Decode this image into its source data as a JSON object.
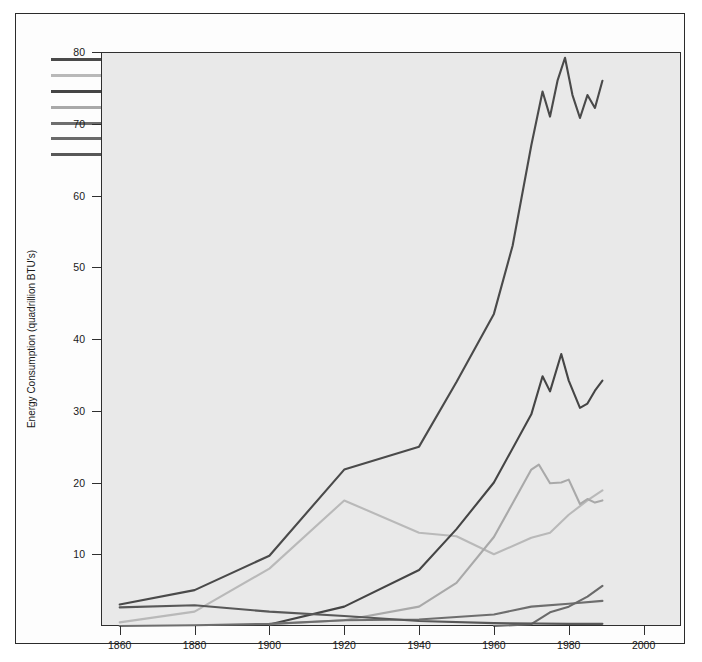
{
  "chart_data": {
    "type": "line",
    "title": "",
    "xlabel": "",
    "ylabel": "Energy Consumption (quadrillion BTU's)",
    "xlim": [
      1855,
      2010
    ],
    "ylim": [
      0,
      80
    ],
    "xticks": [
      1860,
      1880,
      1900,
      1920,
      1940,
      1960,
      1980,
      2000
    ],
    "yticks": [
      10,
      20,
      30,
      40,
      50,
      60,
      70,
      80
    ],
    "grid": false,
    "legend_position": "top-left",
    "series": [
      {
        "name": "Total",
        "color": "#4a4a4a",
        "x": [
          1860,
          1880,
          1900,
          1920,
          1940,
          1950,
          1960,
          1965,
          1970,
          1973,
          1975,
          1977,
          1979,
          1981,
          1983,
          1985,
          1987,
          1989
        ],
        "values": [
          3.0,
          5.0,
          9.8,
          21.8,
          25.0,
          34.0,
          43.5,
          53.0,
          67.0,
          74.5,
          71.0,
          76.0,
          79.2,
          74.0,
          70.8,
          74.0,
          72.2,
          76.0
        ]
      },
      {
        "name": "Coal",
        "color": "#b9b9b9",
        "x": [
          1860,
          1880,
          1900,
          1920,
          1940,
          1950,
          1960,
          1970,
          1975,
          1980,
          1985,
          1989
        ],
        "values": [
          0.5,
          2.0,
          8.0,
          17.5,
          13.0,
          12.5,
          10.0,
          12.3,
          13.0,
          15.5,
          17.5,
          18.9
        ]
      },
      {
        "name": "Oil",
        "color": "#454545",
        "x": [
          1900,
          1920,
          1940,
          1950,
          1960,
          1970,
          1973,
          1975,
          1978,
          1980,
          1983,
          1985,
          1987,
          1989
        ],
        "values": [
          0.2,
          2.7,
          7.8,
          13.5,
          20.0,
          29.5,
          34.8,
          32.7,
          37.9,
          34.2,
          30.4,
          31.0,
          32.8,
          34.2
        ]
      },
      {
        "name": "Natural Gas",
        "color": "#a9a9a9",
        "x": [
          1900,
          1920,
          1940,
          1950,
          1960,
          1970,
          1972,
          1975,
          1978,
          1980,
          1983,
          1985,
          1987,
          1989
        ],
        "values": [
          0.25,
          0.8,
          2.7,
          6.0,
          12.4,
          21.8,
          22.5,
          19.9,
          20.0,
          20.4,
          17.0,
          17.7,
          17.2,
          17.5
        ]
      },
      {
        "name": "Water Power",
        "color": "#6e6e6e",
        "x": [
          1860,
          1880,
          1900,
          1920,
          1940,
          1960,
          1970,
          1980,
          1989
        ],
        "values": [
          0.0,
          0.1,
          0.3,
          0.8,
          0.9,
          1.6,
          2.7,
          3.1,
          3.5
        ]
      },
      {
        "name": "Nuclear Power",
        "color": "#6a6a6a",
        "x": [
          1960,
          1970,
          1975,
          1980,
          1985,
          1989
        ],
        "values": [
          0.0,
          0.25,
          1.9,
          2.7,
          4.1,
          5.6
        ]
      },
      {
        "name": "Wood and Other",
        "color": "#585858",
        "x": [
          1860,
          1880,
          1900,
          1920,
          1940,
          1960,
          1980,
          1989
        ],
        "values": [
          2.6,
          2.9,
          2.0,
          1.4,
          0.7,
          0.4,
          0.3,
          0.3
        ]
      }
    ]
  },
  "legend": {
    "items": [
      {
        "label": "Total"
      },
      {
        "label": "Coal"
      },
      {
        "label": "Oil"
      },
      {
        "label": "Natural Gas"
      },
      {
        "label": "Water Power"
      },
      {
        "label": "Nuclear Power"
      },
      {
        "label": "Wood and Other"
      }
    ]
  },
  "axes": {
    "y_title": "Energy Consumption (quadrillion BTU's)",
    "y_tick_labels": [
      "80",
      "70",
      "60",
      "50",
      "40",
      "30",
      "20",
      "10"
    ],
    "x_tick_labels": [
      "1860",
      "1880",
      "1900",
      "1920",
      "1940",
      "1960",
      "1980",
      "2000"
    ]
  }
}
